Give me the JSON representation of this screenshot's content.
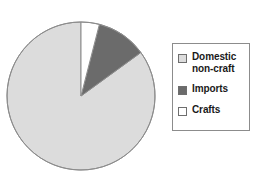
{
  "chart_data": {
    "type": "pie",
    "title": "",
    "categories": [
      "Domestic non-craft",
      "Imports",
      "Crafts"
    ],
    "values": [
      85,
      11,
      4
    ],
    "unit": "%",
    "colors": [
      "#dcdcdc",
      "#6b6b6b",
      "#ffffff"
    ],
    "start_angle_deg": 0,
    "direction": "counterclockwise",
    "legend_position": "right",
    "grid": false,
    "xlabel": "",
    "ylabel": ""
  },
  "figure": {
    "background_color": "#ffffff",
    "pie": {
      "center_x": 81,
      "center_y": 96,
      "radius": 74,
      "outline_color": "#8c8c8c"
    },
    "legend": {
      "border_color": "#8c8c8c",
      "background_color": "#ffffff",
      "items": [
        {
          "label": "Domestic\nnon-craft",
          "swatch_color": "#dcdcdc"
        },
        {
          "label": "Imports",
          "swatch_color": "#6b6b6b"
        },
        {
          "label": "Crafts",
          "swatch_color": "#ffffff"
        }
      ]
    }
  }
}
